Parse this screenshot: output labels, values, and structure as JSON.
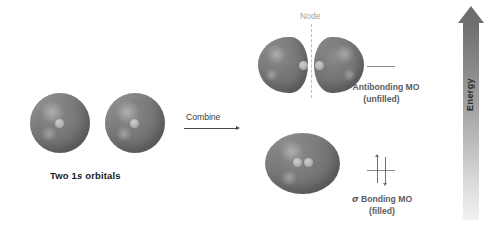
{
  "diagram": {
    "colors": {
      "orbital_fill": "#737373",
      "nucleus": "#bdbdbd",
      "node_line": "#bcbcbc",
      "node_label": "#a3a3a3",
      "mo_label": "#5c5c5c",
      "mo_line": "#8a8a8a",
      "electron_arrow": "#6f6f6f",
      "combine_arrow": "#4a4a4a",
      "energy_arrow_top": "#6e6e6e",
      "energy_arrow_bottom": "#f2f2f2",
      "background": "#ffffff",
      "text": "#1b1b1b"
    }
  },
  "atomic_orbitals": {
    "label_prefix": "Two 1",
    "label_italic": "s",
    "label_suffix": " orbitals",
    "count": 2
  },
  "combine": {
    "label": "Combine",
    "arrow_direction": "right"
  },
  "node": {
    "label": "Node",
    "line_style": "dashed",
    "orientation": "vertical"
  },
  "antibonding": {
    "sigma": "σ",
    "name": " Antibonding MO",
    "state": "(unfilled)",
    "electron_count": 0,
    "lobes": 2
  },
  "bonding": {
    "sigma": "σ",
    "name": " Bonding MO",
    "state": "(filled)",
    "electron_count": 2,
    "electron_spins": [
      "up",
      "down"
    ],
    "lobes": 1
  },
  "energy_axis": {
    "label": "Energy",
    "direction": "up",
    "low_end": "bottom",
    "high_end": "top"
  }
}
